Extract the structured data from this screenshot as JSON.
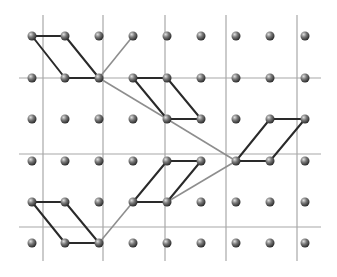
{
  "diagram": {
    "colors": {
      "background": "#ffffff",
      "grid_line": "#a8a8a8",
      "cell_edge": "#2a2a2a",
      "connector": "#8e8e8e",
      "sphere_light": "#d8d8d8",
      "sphere_mid": "#7a7a7a",
      "sphere_dark": "#2e2e2e"
    },
    "lattice": {
      "columns_x": [
        32,
        65,
        99,
        133,
        167,
        201,
        236,
        270,
        305
      ],
      "rows_y": [
        36,
        78,
        119,
        161,
        202,
        243
      ],
      "sphere_radius": 4.5
    },
    "grid": {
      "vertical_x": [
        43,
        103,
        165,
        226,
        297
      ],
      "vertical_y_range": [
        15,
        261
      ],
      "horizontal_y": [
        78,
        154,
        227
      ],
      "horizontal_x_range": [
        19,
        321
      ]
    },
    "cells": [
      {
        "name": "cell-top-left",
        "points": [
          [
            0,
            0
          ],
          [
            1,
            0
          ],
          [
            2,
            1
          ],
          [
            1,
            1
          ]
        ]
      },
      {
        "name": "cell-upper-middle",
        "points": [
          [
            3,
            1
          ],
          [
            4,
            1
          ],
          [
            5,
            2
          ],
          [
            4,
            2
          ]
        ]
      },
      {
        "name": "cell-right",
        "points": [
          [
            6,
            3
          ],
          [
            7,
            3
          ],
          [
            8,
            2
          ],
          [
            7,
            2
          ]
        ]
      },
      {
        "name": "cell-lower-middle",
        "points": [
          [
            3,
            4
          ],
          [
            4,
            3
          ],
          [
            5,
            3
          ],
          [
            4,
            4
          ]
        ]
      },
      {
        "name": "cell-bottom-left",
        "points": [
          [
            0,
            4
          ],
          [
            1,
            4
          ],
          [
            2,
            5
          ],
          [
            1,
            5
          ]
        ]
      }
    ],
    "connectors": [
      {
        "name": "connector-1",
        "from": [
          2,
          1
        ],
        "to": [
          3,
          0
        ]
      },
      {
        "name": "connector-2",
        "from": [
          2,
          1
        ],
        "to": [
          4,
          2
        ]
      },
      {
        "name": "connector-3",
        "from": [
          4,
          2
        ],
        "to": [
          6,
          3
        ]
      },
      {
        "name": "connector-4",
        "from": [
          4,
          4
        ],
        "to": [
          6,
          3
        ]
      },
      {
        "name": "connector-5",
        "from": [
          2,
          5
        ],
        "to": [
          3,
          4
        ]
      }
    ]
  }
}
